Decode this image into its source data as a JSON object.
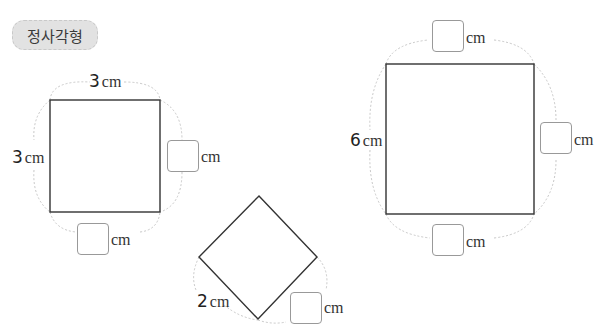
{
  "title": "정사각형",
  "unit": "cm",
  "shapes": [
    {
      "name": "square-3cm",
      "given": [
        {
          "side": "top",
          "value": "3"
        },
        {
          "side": "left",
          "value": "3"
        }
      ],
      "blanks": [
        "right",
        "bottom"
      ]
    },
    {
      "name": "diamond-2cm",
      "given": [
        {
          "side": "bottom-left",
          "value": "2"
        }
      ],
      "blanks": [
        "bottom-right"
      ]
    },
    {
      "name": "square-6cm",
      "given": [
        {
          "side": "left",
          "value": "6"
        }
      ],
      "blanks": [
        "top",
        "right",
        "bottom"
      ]
    }
  ],
  "colors": {
    "outline": "#333333",
    "dashed_arc": "#c8c8c8",
    "badge_bg": "#e2e2e2"
  }
}
